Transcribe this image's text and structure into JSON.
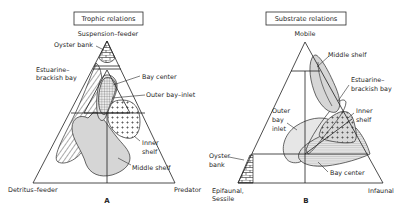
{
  "figure": {
    "panels": [
      {
        "id": "A",
        "letter": "A",
        "title": "Trophic relations",
        "vertices": {
          "top": "Suspension–feeder",
          "bottom_left": "Detritus–feeder",
          "bottom_right": "Predator"
        },
        "fields": [
          {
            "name": "Oyster bank",
            "pattern": "brick"
          },
          {
            "name": "Estuarine–brackish bay",
            "pattern": "diagonal-hatch"
          },
          {
            "name": "Bay center",
            "pattern": "cross-hatch"
          },
          {
            "name": "Outer bay–inlet",
            "pattern": "light-gray"
          },
          {
            "name": "Inner shelf",
            "pattern": "plus-dots"
          },
          {
            "name": "Middle shelf",
            "pattern": "gray"
          }
        ],
        "labels": {
          "oyster_bank": "Oyster bank",
          "estuarine_1": "Estuarine–",
          "estuarine_2": "brackish bay",
          "bay_center": "Bay center",
          "outer_bay": "Outer bay–inlet",
          "inner_shelf_1": "Inner",
          "inner_shelf_2": "shelf",
          "middle_shelf": "Middle shelf"
        }
      },
      {
        "id": "B",
        "letter": "B",
        "title": "Substrate relations",
        "vertices": {
          "top": "Mobile",
          "bottom_left_1": "Epifaunal,",
          "bottom_left_2": "Sessile",
          "bottom_right": "Infaunal"
        },
        "fields": [
          {
            "name": "Middle shelf",
            "pattern": "gray"
          },
          {
            "name": "Estuarine–brackish bay",
            "pattern": "outline"
          },
          {
            "name": "Inner shelf",
            "pattern": "plus-dots"
          },
          {
            "name": "Outer bay inlet",
            "pattern": "light-gray"
          },
          {
            "name": "Oyster bank",
            "pattern": "brick"
          },
          {
            "name": "Bay center",
            "pattern": "cross-hatch"
          }
        ],
        "labels": {
          "middle_shelf": "Middle shelf",
          "estuarine_1": "Estuarine–",
          "estuarine_2": "brackish bay",
          "inner_shelf_1": "Inner",
          "inner_shelf_2": "shelf",
          "outer_1": "Outer",
          "outer_2": "bay",
          "outer_3": "inlet",
          "oyster_1": "Oyster",
          "oyster_2": "bank",
          "bay_center": "Bay center"
        }
      }
    ],
    "colors": {
      "line": "#1f1f1f",
      "gray_fill": "#d6d6d6",
      "light_gray_fill": "#e6e6e6",
      "background": "#ffffff"
    }
  }
}
